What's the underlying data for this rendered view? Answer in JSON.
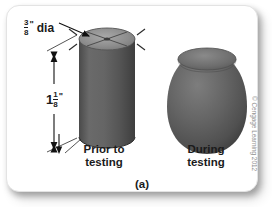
{
  "figure": {
    "panel_background": "#ffffff",
    "sub_label": "(a)",
    "copyright": "© Cengage Learning 2012",
    "dimensions": {
      "diameter": {
        "numerator": "3",
        "denominator": "8",
        "unit_mark": "\"",
        "word": "dia"
      },
      "length": {
        "whole": "1",
        "numerator": "1",
        "denominator": "8",
        "unit_mark": "\""
      }
    },
    "specimens": [
      {
        "name": "cylinder-before",
        "caption_line1": "Prior to",
        "caption_line2": "testing",
        "body_color": "#5c5c5c",
        "top_face_color": "#8f8f8f"
      },
      {
        "name": "barrel-during",
        "caption_line1": "During",
        "caption_line2": "testing",
        "body_color": "#5c5c5c",
        "top_face_color": "#6e6e6e"
      }
    ]
  }
}
